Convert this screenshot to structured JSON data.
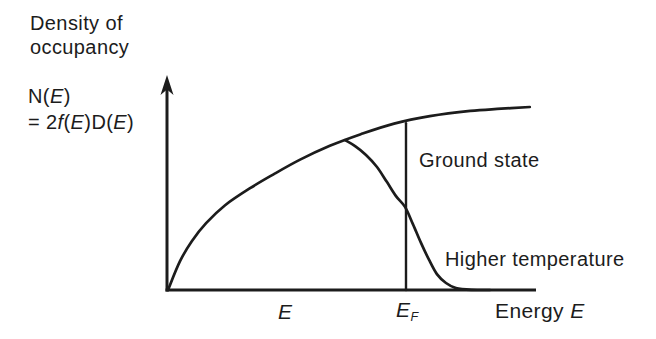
{
  "figure": {
    "background": "#ffffff",
    "ink_color": "#1c1c1c"
  },
  "labels": {
    "title": [
      "Density of",
      "occupancy"
    ],
    "y_formula": [
      [
        {
          "t": "N("
        },
        {
          "t": "E",
          "it": true
        },
        {
          "t": ")"
        }
      ],
      [
        {
          "t": "= 2"
        },
        {
          "t": "f",
          "it": true
        },
        {
          "t": "("
        },
        {
          "t": "E",
          "it": true
        },
        {
          "t": ")D("
        },
        {
          "t": "E",
          "it": true
        },
        {
          "t": ")"
        }
      ]
    ],
    "ground_state": "Ground state",
    "higher_temperature": "Higher temperature",
    "x_e": [
      {
        "t": "E",
        "it": true
      }
    ],
    "x_ef": [
      {
        "t": "E",
        "it": true
      },
      {
        "t": "F",
        "it": true,
        "sub": true
      }
    ],
    "x_energy": [
      {
        "t": "Energy "
      },
      {
        "t": "E",
        "it": true
      }
    ]
  },
  "chart_data": {
    "type": "line",
    "title": "Density of occupancy",
    "xlabel": "Energy E",
    "ylabel": "N(E) = 2f(E)D(E)",
    "x_units": "E in units of E_F (Fermi energy = 1.0)",
    "y_units": "arbitrary (0 to 1)",
    "x_range": [
      0,
      1.55
    ],
    "y_range": [
      0,
      1
    ],
    "fermi_energy_x": 1.0,
    "grid": false,
    "legend": "inline annotations (Ground state, Higher temperature)",
    "x_tick_labels": [
      "E",
      "E_F"
    ],
    "series": [
      {
        "name": "Density-of-states envelope 2D(E) (equals ground-state occupancy for E < E_F)",
        "points": [
          [
            0,
            0
          ],
          [
            0.05,
            0.135
          ],
          [
            0.1,
            0.23
          ],
          [
            0.16,
            0.315
          ],
          [
            0.24,
            0.4
          ],
          [
            0.345,
            0.48
          ],
          [
            0.45,
            0.55
          ],
          [
            0.555,
            0.615
          ],
          [
            0.68,
            0.68
          ],
          [
            0.81,
            0.735
          ],
          [
            0.95,
            0.785
          ],
          [
            1.1,
            0.82
          ],
          [
            1.27,
            0.845
          ],
          [
            1.4,
            0.855
          ],
          [
            1.52,
            0.863
          ]
        ]
      },
      {
        "name": "Ground state cutoff (occupancy drops to 0 at E_F)",
        "points": [
          [
            1.0,
            0.787
          ],
          [
            1.0,
            0
          ]
        ]
      },
      {
        "name": "Higher temperature",
        "points": [
          [
            0.744,
            0.707
          ],
          [
            0.786,
            0.679
          ],
          [
            0.832,
            0.637
          ],
          [
            0.878,
            0.58
          ],
          [
            0.92,
            0.509
          ],
          [
            0.958,
            0.443
          ],
          [
            0.996,
            0.392
          ],
          [
            1.029,
            0.311
          ],
          [
            1.063,
            0.222
          ],
          [
            1.097,
            0.142
          ],
          [
            1.13,
            0.075
          ],
          [
            1.168,
            0.033
          ],
          [
            1.21,
            0.009
          ],
          [
            1.277,
            0.001
          ],
          [
            1.353,
            0
          ]
        ]
      }
    ]
  }
}
